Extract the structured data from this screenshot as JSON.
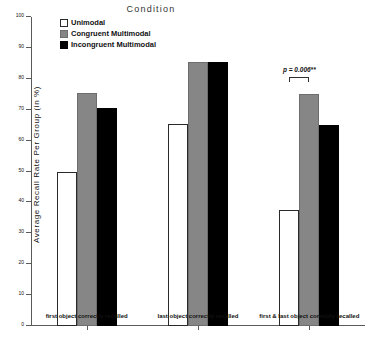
{
  "chart_data": {
    "type": "bar",
    "title": "",
    "xlabel": "",
    "ylabel": "Average Recall Rate Per Group (in %)",
    "ylim": [
      0,
      100
    ],
    "yticks": [
      0,
      10,
      20,
      30,
      40,
      50,
      60,
      70,
      80,
      90,
      100
    ],
    "grid": false,
    "legend_title": "Condition",
    "legend_position": "top-center",
    "categories": [
      "first object correctly recalled",
      "last object correctly recalled",
      "first & last object correctly recalled"
    ],
    "series": [
      {
        "name": "Unimodal",
        "color": "#ffffff",
        "values": [
          50,
          65.5,
          37.5
        ]
      },
      {
        "name": "Congruent Multimodal",
        "color": "#868686",
        "values": [
          75.5,
          85.5,
          75
        ]
      },
      {
        "name": "Incongruent Multimodal",
        "color": "#000000",
        "values": [
          70.5,
          85.5,
          65
        ]
      }
    ],
    "annotations": [
      {
        "text": "p = 0.006**",
        "category": "first & last object correctly recalled",
        "from_series": "Unimodal",
        "to_series": "Congruent Multimodal",
        "y": 80.5
      }
    ]
  },
  "axis": {
    "y_tick_labels": [
      "0",
      "10",
      "20",
      "30",
      "40",
      "50",
      "60",
      "70",
      "80",
      "90",
      "100"
    ]
  }
}
